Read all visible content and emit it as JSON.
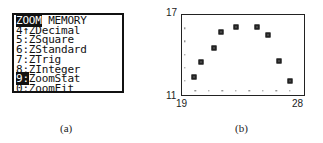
{
  "panel_a": {
    "caption": "(a)",
    "menu": {
      "header": {
        "selected_tab": "ZOOM",
        "other_tab": "MEMORY"
      },
      "items": [
        {
          "key": "4",
          "sep": "↑",
          "label": "ZDecimal",
          "highlighted": false
        },
        {
          "key": "5",
          "sep": ":",
          "label": "ZSquare",
          "highlighted": false
        },
        {
          "key": "6",
          "sep": ":",
          "label": "ZStandard",
          "highlighted": false
        },
        {
          "key": "7",
          "sep": ":",
          "label": "ZTrig",
          "highlighted": false
        },
        {
          "key": "8",
          "sep": ":",
          "label": "ZInteger",
          "highlighted": false
        },
        {
          "key": "9",
          "sep": ":",
          "label": "ZoomStat",
          "highlighted": true
        },
        {
          "key": "0",
          "sep": ":",
          "label": "ZoomFit",
          "highlighted": false
        }
      ]
    }
  },
  "panel_b": {
    "caption": "(b)",
    "x_min_label": "19",
    "x_max_label": "28",
    "y_min_label": "11",
    "y_max_label": "17"
  },
  "chart_data": {
    "type": "scatter",
    "title": "",
    "xlabel": "",
    "ylabel": "",
    "xlim": [
      19,
      28
    ],
    "ylim": [
      11,
      17
    ],
    "x_ticks": [
      20,
      21,
      22,
      23,
      24,
      25,
      26,
      27
    ],
    "y_ticks": [
      12,
      13,
      14,
      15,
      16
    ],
    "grid": false,
    "legend": null,
    "marker": "square",
    "series": [
      {
        "name": "stat plot",
        "x": [
          19.9,
          20.4,
          21.4,
          21.9,
          23.0,
          24.6,
          25.4,
          26.2,
          27.0
        ],
        "y": [
          12.3,
          13.4,
          14.5,
          15.7,
          16.1,
          16.1,
          15.5,
          13.5,
          12.0
        ]
      }
    ]
  }
}
